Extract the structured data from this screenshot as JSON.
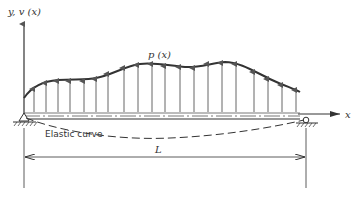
{
  "diagram": {
    "type": "beam-deflection",
    "labels": {
      "y_axis": "y, v (x)",
      "x_axis": "x",
      "load": "p (x)",
      "elastic_curve": "Elastic curve",
      "length": "L"
    },
    "colors": {
      "line": "#333333",
      "arrow": "#555555",
      "background": "#ffffff"
    },
    "supports": [
      {
        "type": "pin",
        "position": "left"
      },
      {
        "type": "roller",
        "position": "right"
      }
    ],
    "load_arrow_count": 20
  }
}
